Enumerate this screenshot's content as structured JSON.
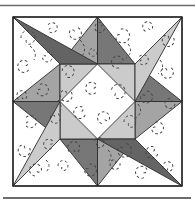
{
  "figure": {
    "type": "quilt-block-pattern",
    "width": 195,
    "height": 204
  },
  "colors": {
    "page_bg": "#ffffff",
    "fabric_white": "#ffffff",
    "fabric_light": "#cbcbcb",
    "fabric_medium": "#a4a4a4",
    "fabric_dark": "#777777",
    "fabric_spike_dark": "#646464",
    "seam": "#2d2d2d",
    "block_border": "#1c1c1c",
    "stitch": "#474747",
    "rule": "#6b6b6b"
  },
  "rules": {
    "top": {
      "x1": 0,
      "y": 5.5,
      "x2": 195,
      "width": 1.7
    },
    "bottom": {
      "x1": 3,
      "y": 198,
      "x2": 191,
      "width": 2.0
    }
  },
  "block": {
    "x": 13,
    "y": 17,
    "size": 169
  },
  "pieces": [
    {
      "name": "block-background",
      "fill": "fabric_white",
      "points": "13,17 182,17 182,186 13,186"
    },
    {
      "name": "star-point-top-left",
      "fill": "fabric_medium",
      "points": "97.5,17 60,64 97.5,64"
    },
    {
      "name": "star-point-top-right",
      "fill": "fabric_dark",
      "points": "97.5,17 135,64 97.5,64"
    },
    {
      "name": "star-point-right-upper",
      "fill": "fabric_dark",
      "points": "182,101.5 135,64 135,101.5"
    },
    {
      "name": "star-point-right-lower",
      "fill": "fabric_medium",
      "points": "182,101.5 135,139 135,101.5"
    },
    {
      "name": "star-point-bottom-right",
      "fill": "fabric_medium",
      "points": "97.5,186 135,139 97.5,139"
    },
    {
      "name": "star-point-bottom-left",
      "fill": "fabric_dark",
      "points": "97.5,186 60,139 97.5,139"
    },
    {
      "name": "star-point-left-lower",
      "fill": "fabric_dark",
      "points": "13,101.5 60,139 60,101.5"
    },
    {
      "name": "star-point-left-upper",
      "fill": "fabric_medium",
      "points": "13,101.5 60,64 60,101.5"
    },
    {
      "name": "center-square",
      "fill": "fabric_light",
      "points": "60,64 135,64 135,139 60,139"
    },
    {
      "name": "center-diamond",
      "fill": "fabric_white",
      "points": "97.5,64 135,101.5 97.5,139 60,101.5"
    },
    {
      "name": "corner-spike-top-left",
      "fill": "fabric_spike_dark",
      "points": "13,17 97.5,64 60,64"
    },
    {
      "name": "corner-spike-top-right",
      "fill": "fabric_light",
      "points": "182,17 135,101.5 135,64"
    },
    {
      "name": "corner-spike-bottom-right",
      "fill": "fabric_spike_dark",
      "points": "182,186 97.5,139 135,139"
    },
    {
      "name": "corner-spike-bottom-left",
      "fill": "fabric_light",
      "points": "13,186 60,101.5 60,139"
    }
  ],
  "stitching": {
    "dash": "2.6 2.4",
    "width": 1,
    "curls": [
      {
        "x": 28,
        "y": 38,
        "r": 7,
        "rot": 0
      },
      {
        "x": 52,
        "y": 28,
        "r": 5,
        "rot": 40
      },
      {
        "x": 75,
        "y": 33,
        "r": 6,
        "rot": 120
      },
      {
        "x": 100,
        "y": 27,
        "r": 5,
        "rot": 200
      },
      {
        "x": 122,
        "y": 36,
        "r": 7,
        "rot": 80
      },
      {
        "x": 148,
        "y": 27,
        "r": 5,
        "rot": 300
      },
      {
        "x": 168,
        "y": 40,
        "r": 6,
        "rot": 160
      },
      {
        "x": 24,
        "y": 66,
        "r": 6,
        "rot": 220
      },
      {
        "x": 47,
        "y": 57,
        "r": 5,
        "rot": 90
      },
      {
        "x": 68,
        "y": 72,
        "r": 6,
        "rot": 10
      },
      {
        "x": 93,
        "y": 52,
        "r": 4,
        "rot": 180
      },
      {
        "x": 118,
        "y": 62,
        "r": 6,
        "rot": 260
      },
      {
        "x": 143,
        "y": 60,
        "r": 5,
        "rot": 45
      },
      {
        "x": 167,
        "y": 72,
        "r": 6,
        "rot": 135
      },
      {
        "x": 22,
        "y": 96,
        "r": 5,
        "rot": 315
      },
      {
        "x": 42,
        "y": 90,
        "r": 6,
        "rot": 70
      },
      {
        "x": 66,
        "y": 95,
        "r": 6,
        "rot": 150
      },
      {
        "x": 92,
        "y": 88,
        "r": 6,
        "rot": 230
      },
      {
        "x": 118,
        "y": 92,
        "r": 7,
        "rot": 20
      },
      {
        "x": 146,
        "y": 97,
        "r": 6,
        "rot": 100
      },
      {
        "x": 170,
        "y": 103,
        "r": 5,
        "rot": 190
      },
      {
        "x": 30,
        "y": 122,
        "r": 6,
        "rot": 50
      },
      {
        "x": 55,
        "y": 118,
        "r": 5,
        "rot": 130
      },
      {
        "x": 80,
        "y": 112,
        "r": 6,
        "rot": 210
      },
      {
        "x": 104,
        "y": 118,
        "r": 6,
        "rot": 290
      },
      {
        "x": 130,
        "y": 122,
        "r": 6,
        "rot": 0
      },
      {
        "x": 157,
        "y": 128,
        "r": 6,
        "rot": 75
      },
      {
        "x": 24,
        "y": 150,
        "r": 6,
        "rot": 160
      },
      {
        "x": 49,
        "y": 144,
        "r": 5,
        "rot": 240
      },
      {
        "x": 74,
        "y": 148,
        "r": 6,
        "rot": 320
      },
      {
        "x": 99,
        "y": 143,
        "r": 5,
        "rot": 30
      },
      {
        "x": 124,
        "y": 150,
        "r": 7,
        "rot": 110
      },
      {
        "x": 152,
        "y": 152,
        "r": 6,
        "rot": 200
      },
      {
        "x": 36,
        "y": 170,
        "r": 6,
        "rot": 280
      },
      {
        "x": 63,
        "y": 166,
        "r": 5,
        "rot": 0
      },
      {
        "x": 90,
        "y": 170,
        "r": 6,
        "rot": 85
      },
      {
        "x": 115,
        "y": 164,
        "r": 5,
        "rot": 170
      },
      {
        "x": 142,
        "y": 172,
        "r": 6,
        "rot": 250
      },
      {
        "x": 168,
        "y": 167,
        "r": 5,
        "rot": 340
      }
    ],
    "paths": [
      "M30,46 Q38,52 34,60",
      "M80,40 Q88,48 82,56",
      "M128,44 Q134,52 126,58",
      "M58,100 Q64,108 58,114",
      "M138,104 Q144,112 136,118",
      "M46,160 Q52,166 46,172",
      "M108,150 Q114,156 108,162",
      "M160,60 Q166,68 158,74"
    ]
  }
}
